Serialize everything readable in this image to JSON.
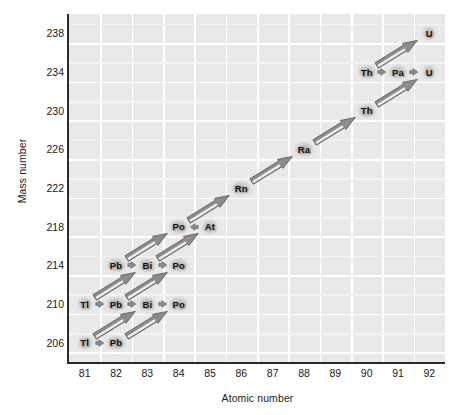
{
  "figure": {
    "axes": {
      "x": {
        "label": "Atomic number",
        "ticks": [
          81,
          82,
          83,
          84,
          85,
          86,
          87,
          88,
          89,
          90,
          91,
          92
        ],
        "min": 80.5,
        "max": 92.5
      },
      "y": {
        "label": "Mass number",
        "ticks": [
          238,
          234,
          230,
          226,
          222,
          218,
          214,
          210,
          206
        ],
        "min": 204,
        "max": 240
      }
    },
    "colors": {
      "plot_background": "#e9e9e9",
      "gridline": "#ffffff",
      "axis": "#2b2b2b",
      "arrow_fill": "#8c8c8c",
      "arrow_highlight": "#efefef",
      "arrow_outline": "#5d5d5d",
      "label_text": "#0d0d0d",
      "label_glow": "#b4b4b4"
    }
  },
  "chart_data": {
    "type": "scatter",
    "xlabel": "Atomic number",
    "ylabel": "Mass number",
    "xlim": [
      80.5,
      92.5
    ],
    "ylim": [
      204,
      240
    ],
    "xticks": [
      81,
      82,
      83,
      84,
      85,
      86,
      87,
      88,
      89,
      90,
      91,
      92
    ],
    "yticks": [
      238,
      234,
      230,
      226,
      222,
      218,
      214,
      210,
      206
    ],
    "grid": true,
    "legend": null,
    "nuclides": [
      {
        "label": "U",
        "z": 92,
        "a": 238
      },
      {
        "label": "Th",
        "z": 90,
        "a": 234
      },
      {
        "label": "Pa",
        "z": 91,
        "a": 234
      },
      {
        "label": "U",
        "z": 92,
        "a": 234
      },
      {
        "label": "Th",
        "z": 90,
        "a": 230
      },
      {
        "label": "Ra",
        "z": 88,
        "a": 226
      },
      {
        "label": "Rn",
        "z": 86,
        "a": 222
      },
      {
        "label": "Po",
        "z": 84,
        "a": 218
      },
      {
        "label": "At",
        "z": 85,
        "a": 218
      },
      {
        "label": "Pb",
        "z": 82,
        "a": 214
      },
      {
        "label": "Bi",
        "z": 83,
        "a": 214
      },
      {
        "label": "Po",
        "z": 84,
        "a": 214
      },
      {
        "label": "Tl",
        "z": 81,
        "a": 210
      },
      {
        "label": "Pb",
        "z": 82,
        "a": 210
      },
      {
        "label": "Bi",
        "z": 83,
        "a": 210
      },
      {
        "label": "Po",
        "z": 84,
        "a": 210
      },
      {
        "label": "Tl",
        "z": 81,
        "a": 206
      },
      {
        "label": "Pb",
        "z": 82,
        "a": 206
      }
    ],
    "decays": [
      {
        "kind": "alpha",
        "from": {
          "z": 92,
          "a": 238
        },
        "to": {
          "z": 90,
          "a": 234
        }
      },
      {
        "kind": "beta",
        "from": {
          "z": 90,
          "a": 234
        },
        "to": {
          "z": 91,
          "a": 234
        }
      },
      {
        "kind": "beta",
        "from": {
          "z": 91,
          "a": 234
        },
        "to": {
          "z": 92,
          "a": 234
        }
      },
      {
        "kind": "alpha",
        "from": {
          "z": 92,
          "a": 234
        },
        "to": {
          "z": 90,
          "a": 230
        }
      },
      {
        "kind": "alpha",
        "from": {
          "z": 90,
          "a": 230
        },
        "to": {
          "z": 88,
          "a": 226
        }
      },
      {
        "kind": "alpha",
        "from": {
          "z": 88,
          "a": 226
        },
        "to": {
          "z": 86,
          "a": 222
        }
      },
      {
        "kind": "alpha",
        "from": {
          "z": 86,
          "a": 222
        },
        "to": {
          "z": 84,
          "a": 218
        }
      },
      {
        "kind": "beta",
        "from": {
          "z": 85,
          "a": 218
        },
        "to": {
          "z": 84,
          "a": 218
        },
        "direction": "left"
      },
      {
        "kind": "alpha",
        "from": {
          "z": 84,
          "a": 218
        },
        "to": {
          "z": 82,
          "a": 214
        }
      },
      {
        "kind": "alpha",
        "from": {
          "z": 85,
          "a": 218
        },
        "to": {
          "z": 83,
          "a": 214
        }
      },
      {
        "kind": "beta",
        "from": {
          "z": 82,
          "a": 214
        },
        "to": {
          "z": 83,
          "a": 214
        }
      },
      {
        "kind": "beta",
        "from": {
          "z": 83,
          "a": 214
        },
        "to": {
          "z": 84,
          "a": 214
        }
      },
      {
        "kind": "alpha",
        "from": {
          "z": 83,
          "a": 214
        },
        "to": {
          "z": 81,
          "a": 210
        }
      },
      {
        "kind": "alpha",
        "from": {
          "z": 84,
          "a": 214
        },
        "to": {
          "z": 82,
          "a": 210
        }
      },
      {
        "kind": "beta",
        "from": {
          "z": 81,
          "a": 210
        },
        "to": {
          "z": 82,
          "a": 210
        }
      },
      {
        "kind": "beta",
        "from": {
          "z": 82,
          "a": 210
        },
        "to": {
          "z": 83,
          "a": 210
        }
      },
      {
        "kind": "beta",
        "from": {
          "z": 83,
          "a": 210
        },
        "to": {
          "z": 84,
          "a": 210
        }
      },
      {
        "kind": "alpha",
        "from": {
          "z": 83,
          "a": 210
        },
        "to": {
          "z": 81,
          "a": 206
        }
      },
      {
        "kind": "alpha",
        "from": {
          "z": 84,
          "a": 210
        },
        "to": {
          "z": 82,
          "a": 206
        }
      },
      {
        "kind": "beta",
        "from": {
          "z": 81,
          "a": 206
        },
        "to": {
          "z": 82,
          "a": 206
        }
      }
    ]
  }
}
